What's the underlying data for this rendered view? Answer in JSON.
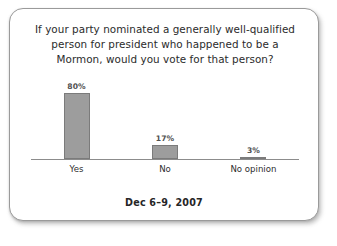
{
  "card": {
    "border_color": "#9a9a9a",
    "background": "#ffffff"
  },
  "footer": {
    "date": "Dec 6–9, 2007"
  },
  "chart_data": {
    "type": "bar",
    "title": "If your party nominated a generally well-qualified\nperson for president who happened to be a\nMormon, would you vote for that person?",
    "subtitle": "Dec 6–9, 2007",
    "categories": [
      "Yes",
      "No",
      "No opinion"
    ],
    "values": [
      80,
      17,
      3
    ],
    "value_labels": [
      "80%",
      "17%",
      "3%"
    ],
    "xlabel": "",
    "ylabel": "",
    "ylim": [
      0,
      100
    ],
    "grid": false,
    "legend": "none",
    "orientation": "vertical",
    "bar_color": "#9d9d9d",
    "bar_border_color": "#7b7b7b",
    "axis_color": "#8c8c8c",
    "label_color": "#2e2e2e",
    "value_label_color": "#4f4f4f"
  }
}
